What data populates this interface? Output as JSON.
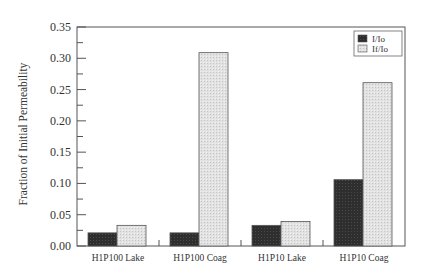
{
  "chart_data": {
    "type": "bar",
    "title": "",
    "xlabel": "",
    "ylabel": "Fraction of Initial Permeability",
    "categories": [
      "H1P100 Lake",
      "H1P100 Coag",
      "H1P10 Lake",
      "H1P10 Coag"
    ],
    "series": [
      {
        "name": "I/Io",
        "color": "#2a2a2a",
        "values": [
          0.021,
          0.021,
          0.033,
          0.106
        ]
      },
      {
        "name": "If/Io",
        "color": "#d9d9d9",
        "values": [
          0.033,
          0.309,
          0.039,
          0.261
        ]
      }
    ],
    "ylim": [
      0,
      0.35
    ],
    "yticks": [
      "0.00",
      "0.05",
      "0.10",
      "0.15",
      "0.20",
      "0.25",
      "0.30",
      "0.35"
    ],
    "ytick_values": [
      0,
      0.05,
      0.1,
      0.15,
      0.2,
      0.25,
      0.3,
      0.35
    ],
    "grid": false,
    "legend_position": "upper right"
  }
}
